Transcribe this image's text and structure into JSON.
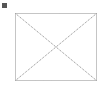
{
  "marker": {
    "color": "#555555"
  },
  "placeholder": {
    "kind": "empty-image-frame",
    "stroke_color": "#8a8a8a",
    "rect": {
      "x": 15,
      "y": 13,
      "width": 82,
      "height": 68
    }
  }
}
